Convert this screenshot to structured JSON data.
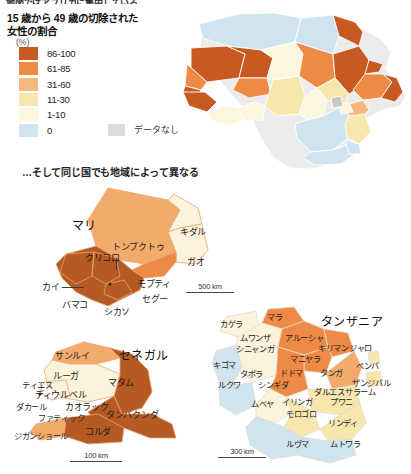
{
  "cut_off_top_line": "地図ではアフリカに集中している",
  "legend": {
    "title": "15 歳から 49 歳の切除された\n女性の割合",
    "unit": "(%)",
    "items": [
      {
        "label": "86-100",
        "color": "#c65a22"
      },
      {
        "label": "61-85",
        "color": "#ef8a46"
      },
      {
        "label": "31-60",
        "color": "#f5b97e"
      },
      {
        "label": "11-30",
        "color": "#f7e6ae"
      },
      {
        "label": "1-10",
        "color": "#fbf6dd"
      },
      {
        "label": "0",
        "color": "#cfe4ef"
      }
    ],
    "no_data_label": "データなし",
    "no_data_color": "#dcdcdc"
  },
  "subheading": "…そして同じ国でも地域によって異なる",
  "maps": {
    "africa": {
      "name": "africa-choropleth",
      "regions": [
        {
          "id": "morocco",
          "color": "#cfe4ef"
        },
        {
          "id": "algeria",
          "color": "#cfe4ef"
        },
        {
          "id": "tunisia",
          "color": "#cfe4ef"
        },
        {
          "id": "libya",
          "color": "#cfe4ef"
        },
        {
          "id": "egypt",
          "color": "#c65a22"
        },
        {
          "id": "mauritania",
          "color": "#c65a22"
        },
        {
          "id": "mali",
          "color": "#c65a22"
        },
        {
          "id": "niger",
          "color": "#fbf6dd"
        },
        {
          "id": "chad",
          "color": "#ef8a46"
        },
        {
          "id": "sudan",
          "color": "#c65a22"
        },
        {
          "id": "eritrea",
          "color": "#c65a22"
        },
        {
          "id": "ethiopia",
          "color": "#ef8a46"
        },
        {
          "id": "somalia",
          "color": "#c65a22"
        },
        {
          "id": "senegal",
          "color": "#ef8a46"
        },
        {
          "id": "gambia",
          "color": "#c65a22"
        },
        {
          "id": "guinea",
          "color": "#c65a22"
        },
        {
          "id": "sierraleone",
          "color": "#c65a22"
        },
        {
          "id": "burkina",
          "color": "#ef8a46"
        },
        {
          "id": "nigeria",
          "color": "#f7e6ae"
        },
        {
          "id": "ghana",
          "color": "#fbf6dd"
        },
        {
          "id": "benin",
          "color": "#fbf6dd"
        },
        {
          "id": "cameroon",
          "color": "#fbf6dd"
        },
        {
          "id": "car",
          "color": "#f7e6ae"
        },
        {
          "id": "drc",
          "color": "#cfe4ef"
        },
        {
          "id": "kenya",
          "color": "#f5b97e"
        },
        {
          "id": "uganda",
          "color": "#fbf6dd"
        },
        {
          "id": "tanzania",
          "color": "#f7e6ae"
        },
        {
          "id": "southern",
          "color": "#cfe4ef"
        },
        {
          "id": "nodata-1",
          "color": "#c6c9c6"
        }
      ]
    },
    "mali": {
      "country_label": "マリ",
      "scale": "500 km",
      "regions": [
        {
          "label": "トンブクトゥ",
          "x": 60,
          "y": 73,
          "color": "#f3ab6c"
        },
        {
          "label": "キダル",
          "x": 136,
          "y": 48,
          "color": "#fbf3dc"
        },
        {
          "label": "ガオ",
          "x": 139,
          "y": 83,
          "color": "#fbf3dc"
        },
        {
          "label": "モプティ",
          "x": 90,
          "y": 106,
          "color": "#ef8a46"
        },
        {
          "label": "クリコロ",
          "x": 37,
          "y": 91,
          "color": "#b65a24"
        },
        {
          "label": "カイ",
          "x": -15,
          "y": 112,
          "color": "#b65a24"
        },
        {
          "label": "バマコ",
          "x": 20,
          "y": 130,
          "color": "#b65a24"
        },
        {
          "label": "シカソ",
          "x": 57,
          "y": 140,
          "color": "#b65a24"
        },
        {
          "label": "セグー",
          "x": 95,
          "y": 124,
          "color": "#b65a24"
        }
      ]
    },
    "senegal": {
      "country_label": "セネガル",
      "scale": "100 km",
      "regions": [
        {
          "label": "サンルイ",
          "x": 40,
          "y": 18,
          "color": "#f3ab6c"
        },
        {
          "label": "ルーガ",
          "x": 37,
          "y": 38,
          "color": "#fbf3dc"
        },
        {
          "label": "マタム",
          "x": 85,
          "y": 44,
          "color": "#b65a24"
        },
        {
          "label": "ティエス",
          "x": 6,
          "y": 48,
          "color": "#fbf3dc"
        },
        {
          "label": "ディウルベル",
          "x": 27,
          "y": 54,
          "color": "#fbf3dc"
        },
        {
          "label": "ダカール",
          "x": -1,
          "y": 66,
          "color": "#fbf3dc"
        },
        {
          "label": "カオラック",
          "x": 42,
          "y": 65,
          "color": "#fbf3dc"
        },
        {
          "label": "ファティック",
          "x": 17,
          "y": 76,
          "color": "#fbf3dc"
        },
        {
          "label": "タンバクンダ",
          "x": 82,
          "y": 73,
          "color": "#b65a24"
        },
        {
          "label": "コルダ",
          "x": 60,
          "y": 90,
          "color": "#b65a24"
        },
        {
          "label": "ジガンショール",
          "x": -3,
          "y": 95,
          "color": "#f3ab6c"
        }
      ]
    },
    "tanzania": {
      "country_label": "タンザニア",
      "scale": "300 km",
      "regions": [
        {
          "label": "カゲラ",
          "x": 8,
          "y": 17,
          "color": "#fbf3dc"
        },
        {
          "label": "マラ",
          "x": 55,
          "y": 12,
          "color": "#ef8a46"
        },
        {
          "label": "ムワンザ",
          "x": 32,
          "y": 31,
          "color": "#fbf3dc"
        },
        {
          "label": "アルーシャ",
          "x": 76,
          "y": 33,
          "color": "#ef8a46"
        },
        {
          "label": "シニャンガ",
          "x": 32,
          "y": 43,
          "color": "#fbf3dc"
        },
        {
          "label": "キリマンジャロ",
          "x": 113,
          "y": 43,
          "color": "#ef8a46"
        },
        {
          "label": "マニヤラ",
          "x": 85,
          "y": 52,
          "color": "#ef8a46"
        },
        {
          "label": "キゴマ",
          "x": 2,
          "y": 59,
          "color": "#cfe4ef"
        },
        {
          "label": "タボラ",
          "x": 32,
          "y": 67,
          "color": "#fbf3dc"
        },
        {
          "label": "ドドマ",
          "x": 73,
          "y": 67,
          "color": "#ef8a46"
        },
        {
          "label": "タンガ",
          "x": 110,
          "y": 66,
          "color": "#f3ab6c"
        },
        {
          "label": "ペンバ",
          "x": 143,
          "y": 60,
          "color": "#f7e6ae"
        },
        {
          "label": "ザンジバル",
          "x": 140,
          "y": 77,
          "color": "#f7e6ae"
        },
        {
          "label": "ルクワ",
          "x": 10,
          "y": 78,
          "color": "#cfe4ef"
        },
        {
          "label": "シンギダ",
          "x": 52,
          "y": 78,
          "color": "#ef8a46"
        },
        {
          "label": "ダルエスサラーム",
          "x": 105,
          "y": 86,
          "color": "#f7e6ae"
        },
        {
          "label": "ムベヤ",
          "x": 45,
          "y": 98,
          "color": "#fbf3dc"
        },
        {
          "label": "イリンガ",
          "x": 74,
          "y": 96,
          "color": "#f7e6ae"
        },
        {
          "label": "プワニ",
          "x": 117,
          "y": 96,
          "color": "#f7e6ae"
        },
        {
          "label": "モロゴロ",
          "x": 78,
          "y": 108,
          "color": "#f7e6ae"
        },
        {
          "label": "リンディ",
          "x": 115,
          "y": 116,
          "color": "#f7e6ae"
        },
        {
          "label": "ルヴマ",
          "x": 78,
          "y": 137,
          "color": "#cfe4ef"
        },
        {
          "label": "ムトワラ",
          "x": 118,
          "y": 137,
          "color": "#cfe4ef"
        }
      ]
    }
  }
}
